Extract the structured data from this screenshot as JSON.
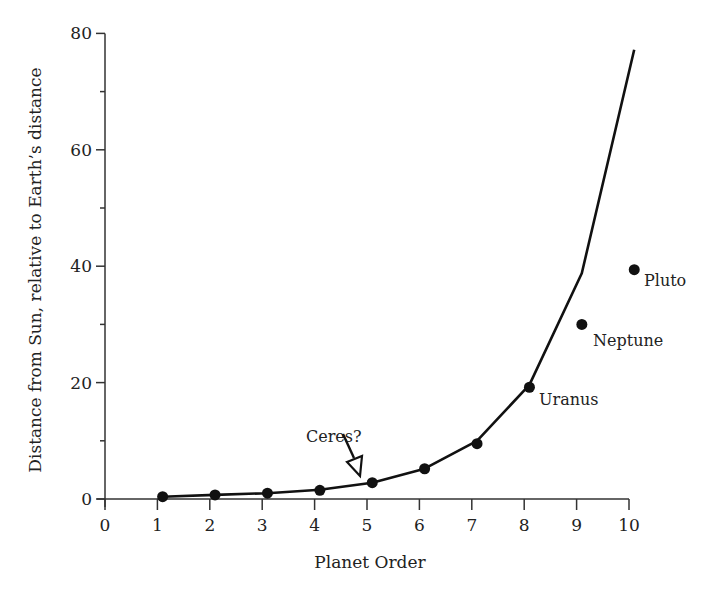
{
  "chart_data": {
    "type": "line",
    "title": "",
    "xlabel": "Planet Order",
    "ylabel": "Distance from Sun, relative to Earth’s distance",
    "xlim": [
      0,
      10
    ],
    "ylim": [
      0,
      80
    ],
    "x_ticks": [
      0,
      1,
      2,
      3,
      4,
      5,
      6,
      7,
      8,
      9,
      10
    ],
    "y_ticks_major": [
      0,
      20,
      40,
      60,
      80
    ],
    "y_ticks_minor": [
      10,
      30,
      50,
      70
    ],
    "grid": false,
    "legend": null,
    "series": [
      {
        "name": "Predicted (Titius–Bode law) curve",
        "kind": "line",
        "color": "#111111",
        "x": [
          1,
          2,
          3,
          4,
          5,
          6,
          7,
          8,
          9,
          10
        ],
        "values": [
          0.4,
          0.7,
          1.0,
          1.6,
          2.8,
          5.2,
          10.0,
          19.6,
          38.8,
          77.2
        ]
      },
      {
        "name": "Actual planet distances",
        "kind": "scatter",
        "color": "#111111",
        "x": [
          1.1,
          2.1,
          3.1,
          4.1,
          5.1,
          6.1,
          7.1,
          8.1,
          9.1,
          10.1
        ],
        "values": [
          0.4,
          0.7,
          1.0,
          1.5,
          2.8,
          5.2,
          9.5,
          19.2,
          30.0,
          39.4
        ],
        "labels": [
          "",
          "",
          "",
          "",
          "",
          "",
          "",
          "Uranus",
          "Neptune",
          "Pluto"
        ]
      }
    ],
    "annotations": [
      {
        "text": "Ceres?",
        "x": 4.7,
        "y": 6.3,
        "arrow_to": [
          4.8,
          3.8
        ],
        "arrow_style": "open-triangle"
      },
      {
        "text": "Uranus",
        "x": 8.35,
        "y": 16.5
      },
      {
        "text": "Neptune",
        "x": 9.35,
        "y": 27.5
      },
      {
        "text": "Pluto",
        "x": 10.3,
        "y": 37.5
      }
    ]
  },
  "labels": {
    "xlabel": "Planet Order",
    "ylabel": "Distance from Sun, relative to Earth’s distance",
    "ceres": "Ceres?",
    "uranus": "Uranus",
    "neptune": "Neptune",
    "pluto": "Pluto"
  }
}
